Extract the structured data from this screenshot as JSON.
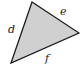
{
  "diagram": {
    "type": "triangle",
    "fill_color": "#d0d0d0",
    "stroke_color": "#1a1a1a",
    "vertices": {
      "top": [
        32,
        2
      ],
      "right": [
        79,
        33
      ],
      "bottom_left": [
        11,
        63
      ]
    },
    "sides": [
      {
        "label": "d",
        "between": [
          "bottom_left",
          "top"
        ]
      },
      {
        "label": "e",
        "between": [
          "top",
          "right"
        ]
      },
      {
        "label": "f",
        "between": [
          "bottom_left",
          "right"
        ]
      }
    ]
  }
}
